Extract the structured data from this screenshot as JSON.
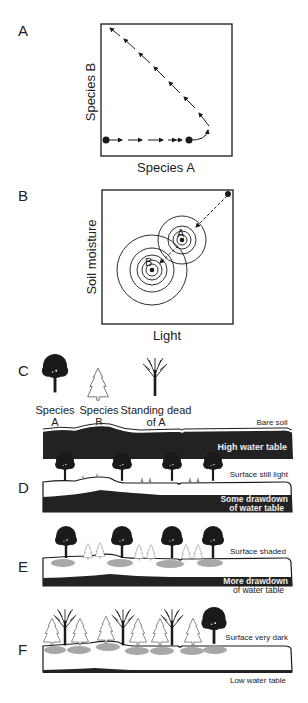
{
  "panels": {
    "A": {
      "label": "A",
      "xlabel": "Species A",
      "ylabel": "Species B"
    },
    "B": {
      "label": "B",
      "xlabel": "Light",
      "ylabel": "Soil moisture",
      "point_a": "A",
      "point_b": "B"
    },
    "C": {
      "label": "C",
      "legend": [
        {
          "line1": "Species",
          "line2": "A"
        },
        {
          "line1": "Species",
          "line2": "B"
        },
        {
          "line1": "Standing dead",
          "line2": "of A"
        }
      ],
      "surface_note": "Bare soil",
      "water_note": "High water table"
    },
    "D": {
      "label": "D",
      "surface_note": "Surface still light",
      "water_note_1": "Some drawdown",
      "water_note_2": "of water table"
    },
    "E": {
      "label": "E",
      "surface_note": "Surface shaded",
      "water_note_1": "More drawdown",
      "water_note_2": "of water table"
    },
    "F": {
      "label": "F",
      "surface_note": "Surface very dark",
      "water_note": "Low water table"
    }
  },
  "colors": {
    "ink": "#1a1a1a",
    "water": "#222222",
    "shade": "#a8a8a8"
  }
}
